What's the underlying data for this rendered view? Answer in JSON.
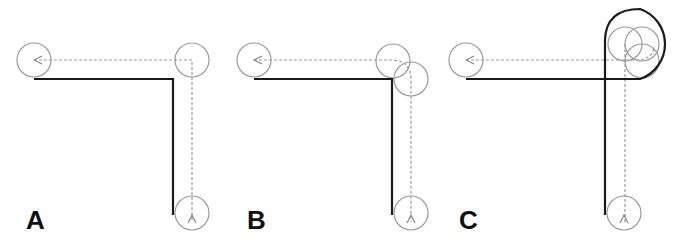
{
  "figure": {
    "panels": [
      {
        "id": "A",
        "label": "A",
        "description": "Path with sharp 90-degree corner; two waypoint circles at corner"
      },
      {
        "id": "B",
        "label": "B",
        "description": "Path with rounded corner; two offset circles at corner"
      },
      {
        "id": "C",
        "label": "C",
        "description": "Path with looping turn; three overlapping circles at corner"
      }
    ],
    "colors": {
      "solid_path": "#1a1a1a",
      "dashed_path": "#9a9a9a",
      "circle": "#9a9a9a",
      "label": "#111111",
      "background": "#ffffff"
    }
  }
}
